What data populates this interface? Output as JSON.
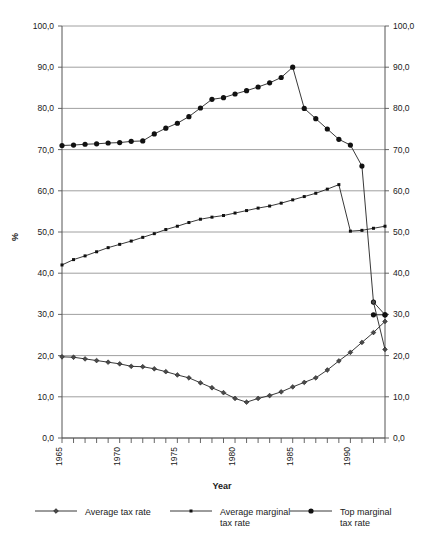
{
  "chart_data": {
    "type": "line",
    "title": "",
    "xlabel": "Year",
    "ylabel": "%",
    "ylim": [
      0,
      100
    ],
    "xlim": [
      1965,
      1993
    ],
    "grid": true,
    "legend_position": "bottom",
    "y_ticks": [
      "0,0",
      "10,0",
      "20,0",
      "30,0",
      "40,0",
      "50,0",
      "60,0",
      "70,0",
      "80,0",
      "90,0",
      "100,0"
    ],
    "y_tick_values": [
      0,
      10,
      20,
      30,
      40,
      50,
      60,
      70,
      80,
      90,
      100
    ],
    "x_tick_labels": [
      "1965",
      "1970",
      "1975",
      "1980",
      "1985",
      "1990"
    ],
    "x_tick_values": [
      1965,
      1970,
      1975,
      1980,
      1985,
      1990
    ],
    "x": [
      1965,
      1966,
      1967,
      1968,
      1969,
      1970,
      1971,
      1972,
      1973,
      1974,
      1975,
      1976,
      1977,
      1978,
      1979,
      1980,
      1981,
      1982,
      1983,
      1984,
      1985,
      1986,
      1987,
      1988,
      1989,
      1990,
      1991,
      1992,
      1993
    ],
    "series": [
      {
        "name": "Average tax rate",
        "marker": "diamond",
        "values": [
          19.7,
          19.6,
          19.2,
          18.8,
          18.4,
          18.0,
          17.4,
          17.3,
          16.8,
          16.1,
          15.3,
          14.6,
          13.4,
          12.2,
          11.0,
          9.6,
          8.7,
          9.6,
          10.3,
          11.2,
          12.4,
          13.5,
          14.6,
          16.5,
          18.7,
          20.8,
          23.2,
          25.6,
          28.3
        ]
      },
      {
        "name": "Average marginal tax rate",
        "marker": "square",
        "values": [
          42.0,
          43.3,
          44.2,
          45.2,
          46.2,
          47.0,
          47.8,
          48.7,
          49.6,
          50.6,
          51.4,
          52.3,
          53.1,
          53.6,
          54.0,
          54.6,
          55.2,
          55.8,
          56.3,
          57.0,
          57.8,
          58.6,
          59.4,
          60.4,
          61.5,
          50.2,
          50.4,
          50.9,
          51.4
        ]
      },
      {
        "name": "Top marginal tax rate",
        "marker": "circle",
        "values": [
          71.0,
          71.1,
          71.3,
          71.4,
          71.6,
          71.7,
          72.0,
          72.1,
          73.8,
          75.2,
          76.4,
          78.0,
          80.1,
          82.2,
          82.6,
          83.5,
          84.3,
          85.2,
          86.2,
          87.5,
          90.0,
          80.0,
          77.5,
          75.0,
          72.5,
          71.1,
          66.0,
          33.0,
          29.9
        ]
      }
    ],
    "extra_series_points": [
      {
        "name": "Average tax rate tail",
        "marker": "diamond",
        "x": [
          1992,
          1993
        ],
        "values": [
          33.0,
          21.5
        ]
      },
      {
        "name": "Top marginal tail",
        "marker": "circle",
        "x": [
          1992,
          1993
        ],
        "values": [
          29.9,
          29.9
        ]
      }
    ]
  },
  "legend": {
    "items": [
      {
        "label": "Average tax rate",
        "marker": "diamond"
      },
      {
        "label": "Average marginal tax rate",
        "marker": "square"
      },
      {
        "label": "Top marginal tax rate",
        "marker": "circle"
      }
    ]
  }
}
